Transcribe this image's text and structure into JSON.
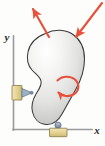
{
  "figure": {
    "background_color": "#fdfdfc"
  },
  "axes": {
    "x_label": "x",
    "y_label": "y",
    "line_color": "#9a9a9a",
    "origin_x": 13,
    "origin_y": 130,
    "x_end": 92,
    "y_end": 36
  },
  "body": {
    "name": "rigid-body",
    "outline_color": "#3a3a3a",
    "fill_light": "#fbfbfa",
    "fill_mid": "#dcdcda",
    "fill_dark": "#a9a9a7"
  },
  "loads": [
    {
      "name": "force-arrow-upper-left",
      "direction": "up-left",
      "color": "#e8503a",
      "tail_x": 49,
      "tail_y": 36,
      "tip_x": 32,
      "tip_y": 8
    },
    {
      "name": "force-arrow-upper-right",
      "direction": "down-left",
      "color": "#e8503a",
      "tail_x": 101,
      "tail_y": 4,
      "tip_x": 75,
      "tip_y": 37
    },
    {
      "name": "couple-moment-arrow",
      "direction": "clockwise",
      "color": "#e8503a",
      "center_x": 66,
      "center_y": 86
    }
  ],
  "supports": [
    {
      "name": "pin-support-left",
      "type": "pin",
      "block_color": "#e8d79a",
      "block_stroke": "#8a7a46",
      "wedge_color": "#8fa8bc",
      "x": 12,
      "y": 86
    },
    {
      "name": "roller-support-bottom",
      "type": "roller",
      "block_color": "#e8d79a",
      "block_stroke": "#8a7a46",
      "roller_color": "#9aa8bc",
      "x": 58,
      "y": 126
    }
  ],
  "colors": {
    "force_red": "#e8503a",
    "axis_gray": "#9a9a9a",
    "body_outline": "#3a3a3a",
    "support_tan": "#e8d79a",
    "support_blue_gray": "#8fa8bc"
  }
}
